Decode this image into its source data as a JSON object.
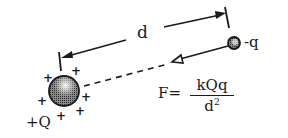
{
  "diagram": {
    "distance_label": "d",
    "source_charge_label": "+Q",
    "test_charge_label": "-q",
    "formula": {
      "lhs": "F=",
      "numerator": "kQq",
      "denominator_base": "d",
      "denominator_exponent": "2"
    },
    "plus_sign": "+",
    "colors": {
      "ink": "#1a1a1a",
      "background": "#ffffff",
      "sphere_fill": "#6e6e6e"
    }
  }
}
